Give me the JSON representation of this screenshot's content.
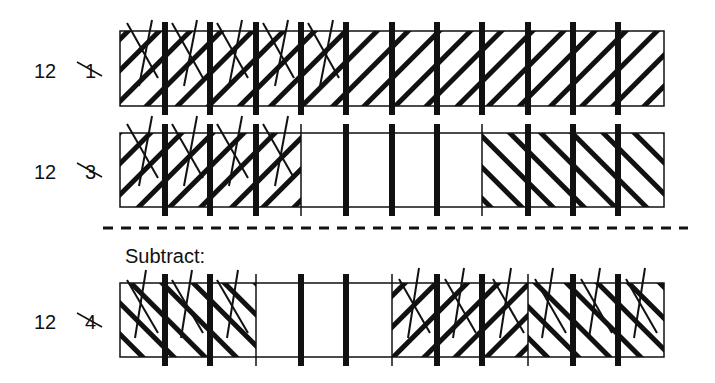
{
  "diagram": {
    "type": "fraction-bar-subtraction",
    "divisions": 12,
    "subtract_label": "Subtract:",
    "rows": [
      {
        "label_number": "12",
        "label_crossed": "1",
        "description": "Whole bar: 12 twelfths, hatched, first 5 twelfths marked with X",
        "parts": 1,
        "hatched_parts": [
          {
            "from": 0,
            "to": 12,
            "dir": "fwd"
          }
        ],
        "crossed_twelfths": [
          0,
          1,
          2,
          3,
          4
        ]
      },
      {
        "label_number": "12",
        "label_crossed": "3",
        "description": "Bar in thirds: first third hatched and crossed, middle empty, last third back-hatched",
        "parts": 3,
        "hatched_parts": [
          {
            "from": 0,
            "to": 4,
            "dir": "fwd"
          },
          {
            "from": 8,
            "to": 12,
            "dir": "back"
          }
        ],
        "crossed_twelfths": [
          0,
          1,
          2,
          3
        ]
      },
      {
        "label_number": "12",
        "label_crossed": "4",
        "description": "Bar in quarters: first quarter back-hatched & crossed, second empty, third fwd-hatched, fourth back-hatched, both crossed",
        "parts": 4,
        "hatched_parts": [
          {
            "from": 0,
            "to": 3,
            "dir": "back"
          },
          {
            "from": 6,
            "to": 9,
            "dir": "fwd"
          },
          {
            "from": 9,
            "to": 12,
            "dir": "back"
          }
        ],
        "crossed_twelfths": [
          0,
          1,
          2,
          6,
          7,
          8,
          9,
          10,
          11
        ]
      }
    ]
  }
}
